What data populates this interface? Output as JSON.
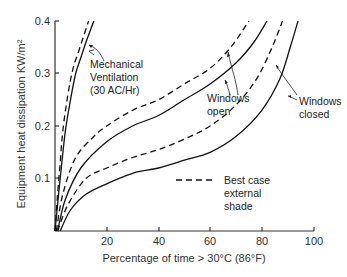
{
  "chart_data": {
    "type": "line",
    "title": "",
    "xlabel": "Percentage of time > 30°C (86°F)",
    "ylabel": "Equipment heat dissipation KW/m²",
    "xlim": [
      0,
      100
    ],
    "ylim": [
      0,
      0.4
    ],
    "xticks": [
      "20",
      "40",
      "60",
      "80",
      "100"
    ],
    "yticks": [
      "0.1",
      "0.2",
      "0.3",
      "0.4"
    ],
    "grid": false,
    "legend": {
      "position": "inside-right",
      "entries": [
        {
          "style": "dashed",
          "label": [
            "Best case",
            "external",
            "shade"
          ]
        }
      ]
    },
    "series": [
      {
        "name": "Mechanical Ventilation (30 AC/Hr)",
        "style": "solid",
        "x": [
          0,
          1,
          2,
          4,
          6,
          8,
          10,
          12,
          15
        ],
        "y": [
          0,
          0.05,
          0.1,
          0.19,
          0.25,
          0.3,
          0.33,
          0.36,
          0.4
        ]
      },
      {
        "name": "Mechanical Ventilation (30 AC/Hr) - best case external shade",
        "style": "dashed",
        "x": [
          0,
          1,
          2,
          3,
          5,
          7,
          9,
          11,
          13
        ],
        "y": [
          0,
          0.07,
          0.13,
          0.19,
          0.26,
          0.31,
          0.34,
          0.37,
          0.4
        ]
      },
      {
        "name": "Windows open",
        "style": "solid",
        "x": [
          1,
          4,
          10,
          20,
          30,
          40,
          50,
          60,
          70,
          77,
          82
        ],
        "y": [
          0,
          0.06,
          0.12,
          0.17,
          0.2,
          0.22,
          0.25,
          0.28,
          0.32,
          0.36,
          0.4
        ]
      },
      {
        "name": "Windows open - best case external shade",
        "style": "dashed",
        "x": [
          0.5,
          3,
          8,
          15,
          20,
          30,
          40,
          50,
          60,
          68,
          75
        ],
        "y": [
          0,
          0.07,
          0.14,
          0.18,
          0.2,
          0.23,
          0.25,
          0.28,
          0.31,
          0.35,
          0.4
        ]
      },
      {
        "name": "Windows closed",
        "style": "solid",
        "x": [
          2,
          6,
          12,
          20,
          30,
          40,
          50,
          60,
          70,
          80,
          87,
          91,
          94
        ],
        "y": [
          0,
          0.04,
          0.07,
          0.09,
          0.11,
          0.12,
          0.135,
          0.15,
          0.18,
          0.23,
          0.29,
          0.35,
          0.4
        ]
      },
      {
        "name": "Windows closed - best case external shade",
        "style": "dashed",
        "x": [
          1,
          5,
          12,
          20,
          30,
          40,
          50,
          60,
          70,
          78,
          84,
          88
        ],
        "y": [
          0,
          0.05,
          0.1,
          0.12,
          0.14,
          0.155,
          0.175,
          0.2,
          0.24,
          0.29,
          0.35,
          0.4
        ]
      }
    ],
    "annotations": [
      {
        "text": [
          "Mechanical",
          "Ventilation",
          "(30 AC/Hr)"
        ],
        "points_to": "Mechanical Ventilation curves"
      },
      {
        "text": [
          "Windows",
          "open"
        ],
        "points_to": "Windows open curves"
      },
      {
        "text": [
          "Windows",
          "closed"
        ],
        "points_to": "Windows closed curves"
      }
    ]
  },
  "labels": {
    "xlabel": "Percentage of time > 30°C (86°F)",
    "ylabel": "Equipment  heat  dissipation KW/m²",
    "xticks": [
      "20",
      "40",
      "60",
      "80",
      "100"
    ],
    "yticks": [
      "0.1",
      "0.2",
      "0.3",
      "0.4"
    ],
    "mech": [
      "Mechanical",
      "Ventilation",
      "(30 AC/Hr)"
    ],
    "open": [
      "Windows",
      "open"
    ],
    "closed": [
      "Windows",
      "closed"
    ],
    "legend": [
      "Best case",
      "external",
      "shade"
    ]
  }
}
